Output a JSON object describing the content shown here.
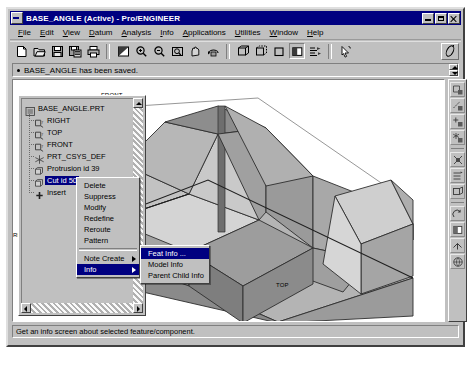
{
  "window": {
    "title": "BASE_ANGLE (Active) - Pro/ENGINEER",
    "sysicon": "system-menu-icon",
    "buttons": {
      "minimize": "minimize-button",
      "maximize": "maximize-button",
      "close": "close-button"
    }
  },
  "menubar": {
    "items": [
      {
        "label": "File",
        "mnemonic": "F"
      },
      {
        "label": "Edit",
        "mnemonic": "E"
      },
      {
        "label": "View",
        "mnemonic": "V"
      },
      {
        "label": "Datum",
        "mnemonic": "D"
      },
      {
        "label": "Analysis",
        "mnemonic": "A"
      },
      {
        "label": "Info",
        "mnemonic": "I"
      },
      {
        "label": "Applications",
        "mnemonic": "A"
      },
      {
        "label": "Utilities",
        "mnemonic": "U"
      },
      {
        "label": "Window",
        "mnemonic": "W"
      },
      {
        "label": "Help",
        "mnemonic": "H"
      }
    ]
  },
  "toolbar": {
    "groups": [
      [
        "new-file-icon",
        "open-folder-icon",
        "save-icon",
        "save-as-icon",
        "print-icon"
      ],
      [
        "repaint-icon",
        "zoom-in-icon",
        "zoom-out-icon",
        "zoom-window-icon",
        "pan-icon",
        "spin-icon"
      ],
      [
        "wireframe-icon",
        "hidden-line-icon",
        "no-hidden-icon",
        "shading-icon",
        "layer-icon"
      ],
      [
        "select-arrow-icon"
      ]
    ],
    "right_icon": "pen-annotate-icon"
  },
  "message_bar": {
    "text": "BASE_ANGLE has been saved.",
    "bullet": "bullet-icon",
    "scroll_up": "scroll-up-arrow",
    "scroll_down": "scroll-down-arrow"
  },
  "model_tree": {
    "items": [
      {
        "label": "BASE_ANGLE.PRT",
        "icon": "part-icon",
        "depth": 0,
        "selected": false
      },
      {
        "label": "RIGHT",
        "icon": "datum-plane-icon",
        "depth": 1,
        "selected": false
      },
      {
        "label": "TOP",
        "icon": "datum-plane-icon",
        "depth": 1,
        "selected": false
      },
      {
        "label": "FRONT",
        "icon": "datum-plane-icon",
        "depth": 1,
        "selected": false
      },
      {
        "label": "PRT_CSYS_DEF",
        "icon": "coord-system-icon",
        "depth": 1,
        "selected": false
      },
      {
        "label": "Protrusion id 39",
        "icon": "feature-icon",
        "depth": 1,
        "selected": false
      },
      {
        "label": "Cut id 50",
        "icon": "feature-icon",
        "depth": 1,
        "selected": true
      },
      {
        "label": "Insert",
        "icon": "insert-marker-icon",
        "depth": 1,
        "selected": false
      }
    ],
    "vscroll": {
      "up": "scroll-up-arrow",
      "down": "scroll-down-arrow"
    },
    "hscroll": {
      "left": "scroll-left-arrow",
      "right": "scroll-right-arrow"
    }
  },
  "context_menu": {
    "items": [
      {
        "label": "Delete",
        "submenu": false,
        "highlighted": false
      },
      {
        "label": "Suppress",
        "submenu": false,
        "highlighted": false
      },
      {
        "label": "Modify",
        "submenu": false,
        "highlighted": false
      },
      {
        "label": "Redefine",
        "submenu": false,
        "highlighted": false
      },
      {
        "label": "Reroute",
        "submenu": false,
        "highlighted": false
      },
      {
        "label": "Pattern",
        "submenu": false,
        "highlighted": false
      },
      {
        "label": "Note Create",
        "submenu": true,
        "highlighted": false
      },
      {
        "label": "Info",
        "submenu": true,
        "highlighted": true
      }
    ]
  },
  "submenu": {
    "items": [
      {
        "label": "Feat Info ...",
        "highlighted": true
      },
      {
        "label": "Model Info",
        "highlighted": false
      },
      {
        "label": "Parent Child Info",
        "highlighted": false
      }
    ]
  },
  "right_toolbar": {
    "buttons": [
      "datum-plane-display-icon",
      "datum-axis-display-icon",
      "datum-point-display-icon",
      "datum-csys-display-icon",
      "spin-center-icon",
      "layer-display-icon",
      "saved-view-icon",
      "repaint-view-icon",
      "shade-view-icon",
      "reorient-view-icon",
      "environment-icon"
    ]
  },
  "viewport": {
    "datum_labels": [
      {
        "text": "FRONT",
        "x": 232,
        "y": 84
      },
      {
        "text": "RIGHT",
        "x": 144,
        "y": 226
      },
      {
        "text": "TOP",
        "x": 407,
        "y": 275
      }
    ]
  },
  "status_bar": {
    "text": "Get an info screen about selected feature/component."
  },
  "colors": {
    "titlebar": "#000080",
    "chrome": "#c0c0c0",
    "canvas": "#ffffff",
    "highlight": "#000080",
    "model_light": "#cdcdcd",
    "model_mid": "#a8a8a8",
    "model_dark": "#8d8d8d",
    "model_darker": "#787878",
    "edge": "#3a3a3a"
  }
}
